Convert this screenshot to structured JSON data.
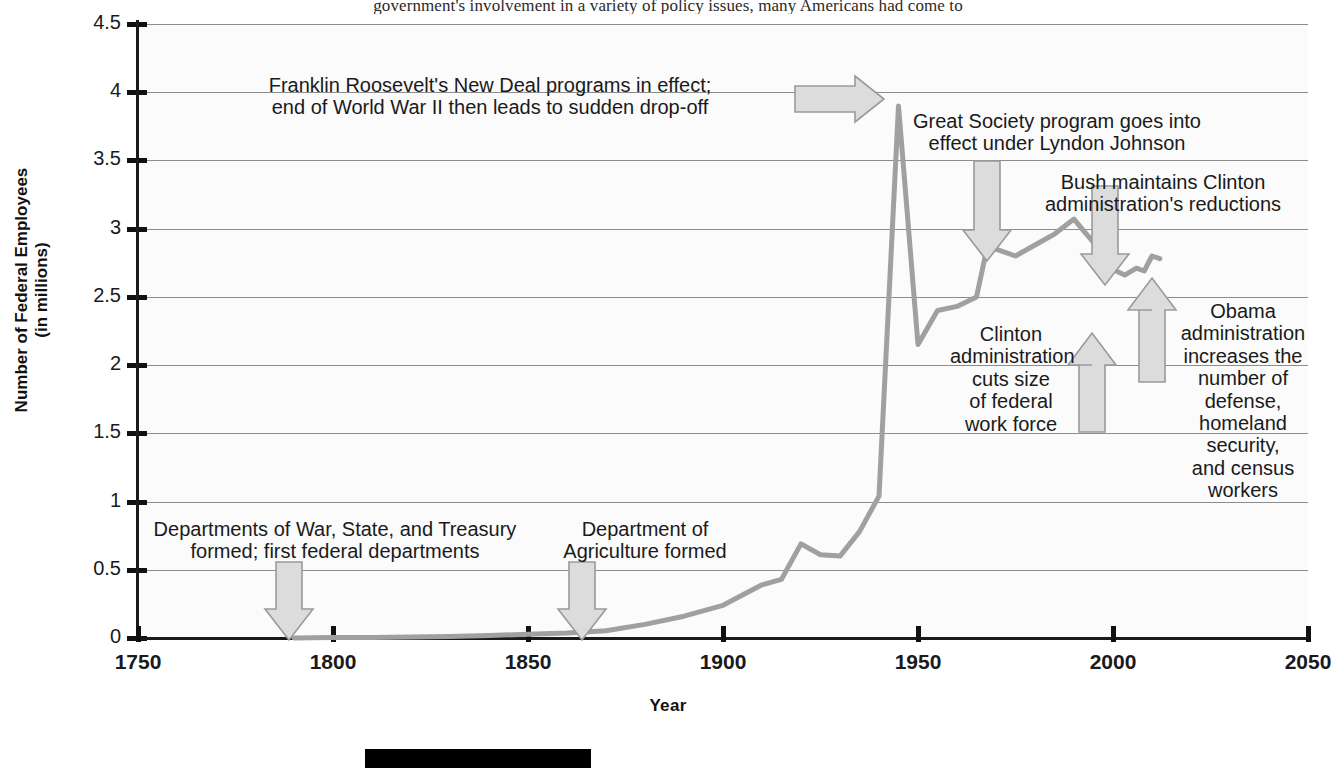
{
  "page_fragment": "government's involvement in a variety of policy issues, many Americans had come to",
  "chart_data": {
    "type": "line",
    "title": "",
    "xlabel": "Year",
    "ylabel": "Number of Federal Employees\n(in millions)",
    "ylabel_line1": "Number of Federal Employees",
    "ylabel_line2": "(in millions)",
    "xlim": [
      1750,
      2050
    ],
    "ylim": [
      0,
      4.5
    ],
    "xticks": [
      1750,
      1800,
      1850,
      1900,
      1950,
      2000,
      2050
    ],
    "xtick_labels": [
      "1750",
      "1800",
      "1850",
      "1900",
      "1950",
      "2000",
      "2050"
    ],
    "yticks": [
      0,
      0.5,
      1,
      1.5,
      2,
      2.5,
      3,
      3.5,
      4,
      4.5
    ],
    "ytick_labels": [
      "0",
      "0.5",
      "1",
      "1.5",
      "2",
      "2.5",
      "3",
      "3.5",
      "4",
      "4.5"
    ],
    "grid": true,
    "legend": "none",
    "series_name": "Number of Federal Employees (in millions)",
    "line_color": "#a0a0a0",
    "x": [
      1790,
      1800,
      1810,
      1820,
      1830,
      1840,
      1850,
      1860,
      1870,
      1880,
      1890,
      1900,
      1910,
      1915,
      1920,
      1925,
      1930,
      1935,
      1940,
      1945,
      1950,
      1955,
      1960,
      1965,
      1968,
      1970,
      1975,
      1980,
      1985,
      1990,
      1992,
      1995,
      2000,
      2003,
      2006,
      2008,
      2010,
      2012
    ],
    "values": [
      0.001,
      0.003,
      0.003,
      0.007,
      0.012,
      0.018,
      0.027,
      0.037,
      0.053,
      0.1,
      0.16,
      0.24,
      0.39,
      0.43,
      0.69,
      0.61,
      0.6,
      0.78,
      1.04,
      3.9,
      2.15,
      2.4,
      2.43,
      2.5,
      2.9,
      2.85,
      2.8,
      2.88,
      2.96,
      3.07,
      3.0,
      2.9,
      2.7,
      2.66,
      2.71,
      2.69,
      2.8,
      2.78
    ]
  },
  "annotations": [
    {
      "id": "fdr-new-deal",
      "text": "Franklin Roosevelt's New Deal programs in effect;\nend of World War II then leads to sudden drop-off",
      "arrow": "right"
    },
    {
      "id": "great-society",
      "text": "Great Society program goes into\neffect under Lyndon Johnson",
      "arrow": "down"
    },
    {
      "id": "bush-maintains",
      "text": "Bush maintains Clinton\nadministration's reductions",
      "arrow": "down"
    },
    {
      "id": "clinton-cuts",
      "text": "Clinton\nadministration\ncuts size\nof federal\nwork force",
      "arrow": "up"
    },
    {
      "id": "obama-increases",
      "text": "Obama\nadministration\nincreases the\nnumber of\ndefense,\nhomeland\nsecurity,\nand census\nworkers",
      "arrow": "up"
    },
    {
      "id": "first-departments",
      "text": "Departments of War, State, and Treasury\nformed; first federal departments",
      "arrow": "down"
    },
    {
      "id": "agriculture-formed",
      "text": "Department of\nAgriculture formed",
      "arrow": "down"
    }
  ],
  "colors": {
    "line": "#a0a0a0",
    "arrow_fill": "#dcdcdc",
    "arrow_stroke": "#9a9a9a",
    "grid": "#8d8d8d",
    "axis": "#111111",
    "text": "#1a1a1a",
    "plot_bg": "#fbfbfb",
    "bar": "#000000"
  }
}
